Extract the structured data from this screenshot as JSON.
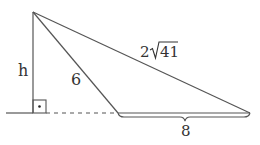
{
  "diagram": {
    "type": "triangle-with-altitude",
    "labels": {
      "height": "h",
      "short_side": "6",
      "long_side_coef": "2",
      "long_side_radicand": "41",
      "base": "8"
    },
    "colors": {
      "stroke": "#555555",
      "text": "#333333",
      "background": "#ffffff"
    },
    "points": {
      "apex": [
        33,
        12
      ],
      "foot": [
        33,
        113
      ],
      "near_base_vertex": [
        118,
        113
      ],
      "far_base_vertex": [
        250,
        113
      ]
    },
    "markers": {
      "right_angle": "square-with-dot"
    }
  }
}
